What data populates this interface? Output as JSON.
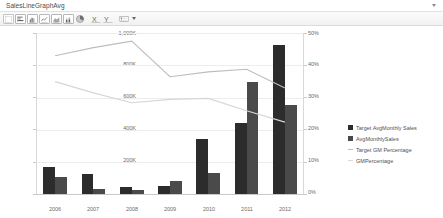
{
  "window": {
    "title": "SalesLineGraphAvg",
    "collapse_icon": "chevron-down-icon"
  },
  "toolbar": {
    "items": [
      {
        "name": "new-chart-button",
        "icon": "blank-page-icon",
        "label": ""
      },
      {
        "name": "bar-chart-button",
        "icon": "bar-chart-icon",
        "label": ""
      },
      {
        "name": "column-chart-button",
        "icon": "column-chart-icon",
        "label": ""
      },
      {
        "name": "line-chart-button",
        "icon": "line-chart-icon",
        "label": ""
      },
      {
        "name": "area-chart-button",
        "icon": "area-chart-icon",
        "label": ""
      },
      {
        "name": "stacked-chart-button",
        "icon": "stacked-chart-icon",
        "label": ""
      },
      {
        "name": "pie-chart-button",
        "icon": "pie-chart-icon",
        "label": ""
      }
    ],
    "axis_x_button": "x-axis-icon",
    "axis_y_button": "y-axis-icon",
    "legend_button": "legend-icon",
    "legend_caret": "chevron-down-icon"
  },
  "chart_data": {
    "type": "bar",
    "title": "",
    "subtitle": "",
    "xlabel": "",
    "ylabel": "",
    "categories": [
      "2006",
      "2007",
      "2008",
      "2009",
      "2010",
      "2011",
      "2012"
    ],
    "grid": true,
    "legend_position": "right",
    "axes": {
      "left": {
        "ticks": [
          "0K",
          "200K",
          "400K",
          "600K",
          "800K",
          "1,000K"
        ],
        "values": [
          0,
          200000,
          400000,
          600000,
          800000,
          1000000
        ],
        "ylim": [
          0,
          1000000
        ]
      },
      "right": {
        "ticks": [
          "0%",
          "10%",
          "20%",
          "30%",
          "40%",
          "50%"
        ],
        "values": [
          0,
          10,
          20,
          30,
          40,
          50
        ],
        "ylim": [
          0,
          50
        ]
      }
    },
    "series": [
      {
        "name": "Target AvgMonthly Sales",
        "type": "bar",
        "axis": "left",
        "color": "#2c2c2c",
        "values": [
          168000,
          124000,
          44000,
          48000,
          340000,
          440000,
          920000
        ]
      },
      {
        "name": "AvgMonthlySales",
        "type": "bar",
        "axis": "left",
        "color": "#4a4a4a",
        "values": [
          104000,
          32000,
          22000,
          78000,
          132000,
          690000,
          548000
        ]
      },
      {
        "name": "Target GM Percentage",
        "type": "line",
        "axis": "right",
        "color": "#bdbdbd",
        "values": [
          43.0,
          45.5,
          47.5,
          36.5,
          38.0,
          38.8,
          33.0
        ]
      },
      {
        "name": "GMPercentage",
        "type": "line",
        "axis": "right",
        "color": "#d6d6d6",
        "values": [
          35.0,
          31.5,
          28.5,
          29.5,
          29.8,
          26.0,
          22.5
        ]
      }
    ]
  }
}
